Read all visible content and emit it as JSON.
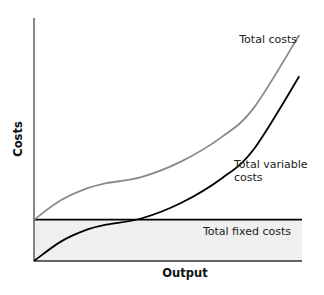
{
  "chart_data": {
    "type": "line",
    "title": "",
    "xlabel": "Output",
    "ylabel": "Costs",
    "xlim": [
      0,
      10
    ],
    "ylim": [
      0,
      10
    ],
    "grid": false,
    "show_ticks": false,
    "x": [
      0,
      1,
      2,
      2.7,
      4,
      5.5,
      7,
      8.2,
      9.9
    ],
    "series": [
      {
        "name": "Total costs",
        "color": "#8a8a8a",
        "values": [
          1.7,
          2.5,
          3.0,
          3.2,
          3.45,
          4.1,
          5.1,
          6.3,
          9.3
        ]
      },
      {
        "name": "Total variable costs",
        "color": "#000000",
        "values": [
          0,
          0.8,
          1.3,
          1.5,
          1.75,
          2.4,
          3.4,
          4.6,
          7.6
        ]
      },
      {
        "name": "Total fixed costs",
        "color": "#000000",
        "fill": "#efefef",
        "values": [
          1.7,
          1.7,
          1.7,
          1.7,
          1.7,
          1.7,
          1.7,
          1.7,
          1.7
        ]
      }
    ],
    "annotations": [
      {
        "text": "Total costs",
        "series": "Total costs"
      },
      {
        "text_lines": [
          "Total variable",
          "costs"
        ],
        "series": "Total variable costs"
      },
      {
        "text": "Total fixed costs",
        "series": "Total fixed costs"
      }
    ]
  }
}
